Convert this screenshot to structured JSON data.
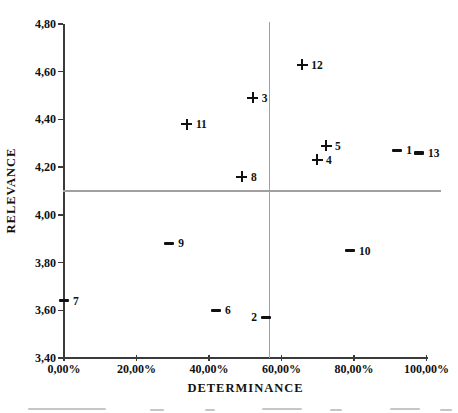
{
  "chart_data": {
    "type": "scatter",
    "title": "",
    "xlabel": "DETERMINANCE",
    "ylabel": "RELEVANCE",
    "xlim": [
      0,
      100
    ],
    "x_unit": "%",
    "ylim": [
      3.4,
      4.8
    ],
    "grid": false,
    "legend": "none",
    "x_tick_labels": [
      "0,00%",
      "20,00%",
      "40,00%",
      "60,00%",
      "80,00%",
      "100,00%"
    ],
    "x_tick_values": [
      0,
      20,
      40,
      60,
      80,
      100
    ],
    "y_tick_labels": [
      "3,40",
      "3,60",
      "3,80",
      "4,00",
      "4,20",
      "4,40",
      "4,60",
      "4,80"
    ],
    "y_tick_values": [
      3.4,
      3.6,
      3.8,
      4.0,
      4.2,
      4.4,
      4.6,
      4.8
    ],
    "quadrant_lines": {
      "x_percent": 56.6,
      "y_value": 4.1
    },
    "points": [
      {
        "id": "1",
        "marker": "minus",
        "determinance_percent": 91.9,
        "relevance": 4.27,
        "label_side": "right"
      },
      {
        "id": "2",
        "marker": "minus",
        "determinance_percent": 55.7,
        "relevance": 3.57,
        "label_side": "left"
      },
      {
        "id": "3",
        "marker": "plus",
        "determinance_percent": 52.1,
        "relevance": 4.49,
        "label_side": "right"
      },
      {
        "id": "4",
        "marker": "plus",
        "determinance_percent": 69.8,
        "relevance": 4.23,
        "label_side": "right"
      },
      {
        "id": "5",
        "marker": "plus",
        "determinance_percent": 72.3,
        "relevance": 4.29,
        "label_side": "right"
      },
      {
        "id": "6",
        "marker": "minus",
        "determinance_percent": 41.9,
        "relevance": 3.6,
        "label_side": "right"
      },
      {
        "id": "7",
        "marker": "minus",
        "determinance_percent": 0.0,
        "relevance": 3.64,
        "label_side": "right"
      },
      {
        "id": "8",
        "marker": "plus",
        "determinance_percent": 49.1,
        "relevance": 4.16,
        "label_side": "right"
      },
      {
        "id": "9",
        "marker": "minus",
        "determinance_percent": 29.0,
        "relevance": 3.88,
        "label_side": "right"
      },
      {
        "id": "10",
        "marker": "minus",
        "determinance_percent": 78.9,
        "relevance": 3.85,
        "label_side": "right"
      },
      {
        "id": "11",
        "marker": "plus",
        "determinance_percent": 33.9,
        "relevance": 4.38,
        "label_side": "right"
      },
      {
        "id": "12",
        "marker": "plus",
        "determinance_percent": 65.7,
        "relevance": 4.63,
        "label_side": "right"
      },
      {
        "id": "13",
        "marker": "minus",
        "determinance_percent": 97.9,
        "relevance": 4.26,
        "label_side": "right"
      }
    ],
    "colors": {
      "marker": "#111111",
      "axis": "#3a3a3a",
      "quadrant_line": "#a0a0a0",
      "text": "#111111",
      "background": "#ffffff"
    }
  }
}
